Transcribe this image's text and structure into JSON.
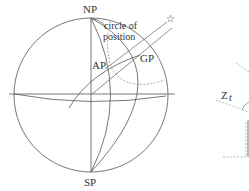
{
  "diagram": {
    "type": "celestial-sphere",
    "labels": {
      "north_pole": "NP",
      "south_pole": "SP",
      "circle_line1": "circle of",
      "circle_line2": "position",
      "assumed_position": "AP",
      "geographic_position": "GP",
      "star": "☆",
      "zenith_angle": "Z",
      "zenith_sub": "t"
    },
    "colors": {
      "line": "#555555",
      "dashed": "#888888",
      "text": "#333333"
    }
  }
}
